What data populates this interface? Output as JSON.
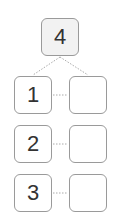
{
  "diagram": {
    "top": {
      "label": "4",
      "fill": "#f2f2f2"
    },
    "rows": [
      {
        "left": "1",
        "right": ""
      },
      {
        "left": "2",
        "right": ""
      },
      {
        "left": "3",
        "right": ""
      }
    ],
    "colors": {
      "border": "#9a9a9a",
      "text": "#333333",
      "connector": "#aaaaaa"
    }
  }
}
